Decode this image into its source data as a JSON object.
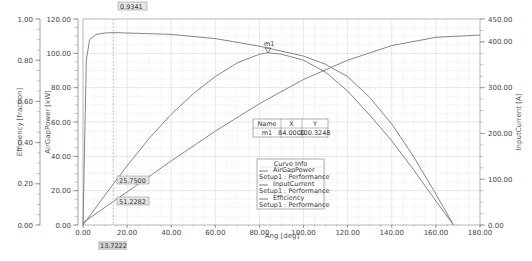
{
  "chart_data": {
    "type": "line",
    "title": "",
    "xlabel": "Ang [deg]",
    "xlim": [
      0,
      180
    ],
    "x_ticks": [
      "0.00",
      "20.00",
      "40.00",
      "60.00",
      "80.00",
      "100.00",
      "120.00",
      "140.00",
      "160.00",
      "180.00"
    ],
    "y_axes": [
      {
        "label": "Efficiency [fraction]",
        "side": "left-outer",
        "range": [
          0,
          1.0
        ],
        "ticks": [
          "0.00",
          "0.20",
          "0.40",
          "0.60",
          "0.80",
          "1.00"
        ]
      },
      {
        "label": "AirGapPower [kW]",
        "side": "left-inner",
        "range": [
          0,
          120
        ],
        "ticks": [
          "0.00",
          "20.00",
          "40.00",
          "60.00",
          "80.00",
          "100.00",
          "120.00"
        ]
      },
      {
        "label": "InputCurrent [A]",
        "side": "right",
        "range": [
          0,
          450
        ],
        "ticks": [
          "0.00",
          "100.00",
          "200.00",
          "300.00",
          "400.00",
          "450.00"
        ]
      }
    ],
    "grid": true,
    "series": [
      {
        "name": "AirGapPower",
        "setup": "Setup1 : Performance",
        "axis": "AirGapPower [kW]",
        "x": [
          0,
          10,
          20,
          30,
          40,
          50,
          60,
          70,
          80,
          84,
          90,
          100,
          110,
          120,
          130,
          140,
          150,
          160,
          168
        ],
        "y": [
          0,
          17.5,
          34.5,
          50.5,
          64.5,
          76.5,
          86.5,
          94.5,
          99.5,
          100.3248,
          99.5,
          96,
          89,
          78,
          64,
          49,
          32,
          14,
          0
        ]
      },
      {
        "name": "InputCurrent",
        "setup": "Setup1 : Performance",
        "axis": "InputCurrent [A]",
        "x": [
          0,
          13.7222,
          20,
          40,
          60,
          80,
          100,
          120,
          140,
          160,
          180
        ],
        "y": [
          5,
          51.2282,
          72,
          140,
          205,
          265,
          318,
          360,
          392,
          410,
          415
        ]
      },
      {
        "name": "Efficiency",
        "setup": "Setup1 : Performance",
        "axis": "Efficiency [fraction]",
        "x": [
          0,
          1.5,
          3,
          6,
          10,
          13.7222,
          20,
          40,
          60,
          80,
          100,
          110,
          120,
          130,
          140,
          150,
          160,
          168
        ],
        "y": [
          0,
          0.8,
          0.9,
          0.925,
          0.932,
          0.9341,
          0.932,
          0.925,
          0.905,
          0.868,
          0.82,
          0.78,
          0.72,
          0.62,
          0.49,
          0.33,
          0.15,
          0
        ]
      }
    ],
    "cursor": {
      "x": 13.7222,
      "label": "13.7222",
      "readouts": [
        {
          "series": "Efficiency",
          "value": "0.9341"
        },
        {
          "series": "AirGapPower",
          "value": "25.7500"
        },
        {
          "series": "InputCurrent",
          "value": "51.2282"
        }
      ]
    },
    "marker": {
      "name": "m1",
      "x": "84.0000",
      "y": "100.3248"
    },
    "legend": {
      "title": "Curve Info",
      "position": "inside-lower-center"
    }
  },
  "marker_table": {
    "headers": [
      "Name",
      "X",
      "Y"
    ],
    "rows": [
      [
        "m1",
        "84.0000",
        "100.3248"
      ]
    ]
  },
  "legend": {
    "title": "Curve Info",
    "entries": [
      {
        "name": "AirGapPower",
        "setup": "Setup1 : Performance"
      },
      {
        "name": "InputCurrent",
        "setup": "Setup1 : Performance"
      },
      {
        "name": "Efficiency",
        "setup": "Setup1 : Performance"
      }
    ]
  },
  "colors": {
    "curve": "#777777",
    "grid": "#d6d6d6",
    "callout_bg": "#e6e6e6"
  }
}
